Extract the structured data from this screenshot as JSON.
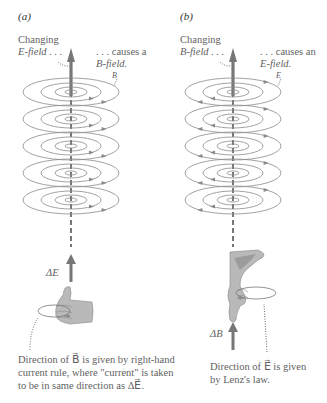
{
  "panels": [
    {
      "id": "a",
      "label": "(a)",
      "source_line1": "Changing",
      "source_line2": "E-field . . .",
      "result_line1": ". . . causes a",
      "result_line2": "B-field.",
      "ring_field_symbol": "B⃗",
      "delta_label": "ΔE⃗",
      "caption_lines": [
        "Direction of B⃗ is given by right-hand",
        "current rule, where \"current\" is taken",
        "to be in same direction as ΔE⃗."
      ],
      "ring_arrow_direction": "right",
      "hand": "thumb-up"
    },
    {
      "id": "b",
      "label": "(b)",
      "source_line1": "Changing",
      "source_line2": "B-field . . .",
      "result_line1": ". . . causes an",
      "result_line2": "E-field.",
      "ring_field_symbol": "E⃗",
      "delta_label": "ΔB⃗",
      "caption_lines": [
        "Direction of E⃗ is given",
        "by Lenz's law."
      ],
      "ring_arrow_direction": "left",
      "hand": "thumb-down"
    }
  ],
  "colors": {
    "ring": "#8a8a8a",
    "axis_arrow": "#777777",
    "hand_fill": "#b9b9b9",
    "hand_shadow": "#9c9c9c",
    "text": "#5f5f5f"
  },
  "ring_layers": 5
}
